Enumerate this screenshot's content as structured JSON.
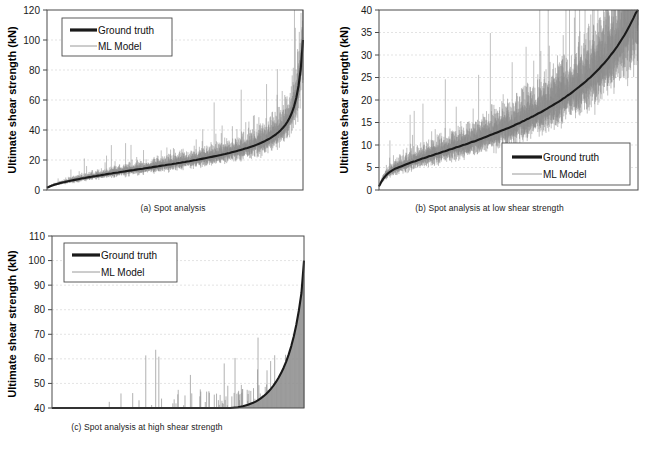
{
  "figure": {
    "panels": [
      "a",
      "b",
      "c"
    ],
    "colors": {
      "ground_truth": "#1a1a1a",
      "ml_model": "#8c8c8c",
      "axis": "#3f3f3f",
      "grid": "#d9d9d9",
      "background": "#ffffff"
    }
  },
  "chart_data": [
    {
      "id": "panel-a",
      "type": "line",
      "title": "",
      "caption": "(a) Spot analysis",
      "xlabel": "",
      "ylabel": "Ultimate shear strength (kN)",
      "ylim": [
        0,
        120
      ],
      "ytick_labels": [
        "0",
        "20",
        "40",
        "60",
        "80",
        "100",
        "120"
      ],
      "yticks": [
        0,
        20,
        40,
        60,
        80,
        100,
        120
      ],
      "xlim": [
        0,
        1
      ],
      "grid": true,
      "legend_position": "top-left",
      "legend": [
        "Ground truth",
        "ML Model"
      ],
      "series": [
        {
          "name": "Ground truth",
          "style": "thick-dark",
          "values": [
            1.5,
            2.2,
            2.8,
            3.3,
            3.8,
            4.2,
            4.6,
            5.0,
            5.3,
            5.7,
            6.0,
            6.3,
            6.6,
            6.9,
            7.2,
            7.5,
            7.8,
            8.0,
            8.3,
            8.6,
            8.8,
            9.1,
            9.3,
            9.6,
            9.8,
            10.1,
            10.3,
            10.6,
            10.8,
            11.0,
            11.3,
            11.5,
            11.7,
            12.0,
            12.2,
            12.4,
            12.7,
            12.9,
            13.1,
            13.3,
            13.6,
            13.8,
            14.0,
            14.2,
            14.5,
            14.7,
            14.9,
            15.1,
            15.4,
            15.6,
            15.8,
            16.1,
            16.3,
            16.5,
            16.8,
            17.0,
            17.2,
            17.5,
            17.7,
            18.0,
            18.2,
            18.5,
            18.7,
            19.0,
            19.2,
            19.5,
            19.8,
            20.0,
            20.3,
            20.6,
            20.9,
            21.2,
            21.5,
            21.8,
            22.1,
            22.4,
            22.7,
            23.0,
            23.3,
            23.7,
            24.0,
            24.4,
            24.7,
            25.1,
            25.5,
            25.9,
            26.3,
            26.7,
            27.1,
            27.6,
            28.0,
            28.5,
            29.0,
            29.5,
            30.1,
            30.7,
            31.3,
            32.0,
            32.7,
            33.5,
            34.3,
            35.2,
            36.2,
            37.3,
            38.5,
            39.9,
            41.5,
            43.3,
            45.5,
            48.2,
            51.5,
            55.8,
            61.5,
            69.5,
            81.0,
            100.0
          ]
        },
        {
          "name": "ML Model",
          "style": "thin-gray-noisy",
          "description": "Noisy predictions scattered around ground truth; spikes up to ~70 kN in mid-range, dense band width grows with magnitude"
        }
      ]
    },
    {
      "id": "panel-b",
      "type": "line",
      "title": "",
      "caption": "(b) Spot analysis at low shear strength",
      "xlabel": "",
      "ylabel": "Ultimate shear strength (kN)",
      "ylim": [
        0,
        40
      ],
      "ytick_labels": [
        "0",
        "5",
        "10",
        "15",
        "20",
        "25",
        "30",
        "35",
        "40"
      ],
      "yticks": [
        0,
        5,
        10,
        15,
        20,
        25,
        30,
        35,
        40
      ],
      "xlim": [
        0,
        1
      ],
      "grid": true,
      "legend_position": "bottom-right",
      "legend": [
        "Ground truth",
        "ML Model"
      ],
      "series": [
        {
          "name": "Ground truth",
          "style": "thick-dark",
          "values": [
            0.8,
            1.8,
            2.6,
            3.2,
            3.7,
            4.1,
            4.4,
            4.7,
            4.9,
            5.1,
            5.3,
            5.5,
            5.7,
            5.9,
            6.1,
            6.3,
            6.4,
            6.6,
            6.8,
            7.0,
            7.1,
            7.3,
            7.5,
            7.6,
            7.8,
            8.0,
            8.1,
            8.3,
            8.5,
            8.6,
            8.8,
            9.0,
            9.1,
            9.3,
            9.5,
            9.6,
            9.8,
            10.0,
            10.1,
            10.3,
            10.5,
            10.7,
            10.8,
            11.0,
            11.2,
            11.4,
            11.6,
            11.8,
            12.0,
            12.2,
            12.4,
            12.6,
            12.8,
            13.0,
            13.2,
            13.4,
            13.6,
            13.8,
            14.0,
            14.2,
            14.5,
            14.7,
            14.9,
            15.2,
            15.4,
            15.7,
            15.9,
            16.2,
            16.4,
            16.7,
            17.0,
            17.2,
            17.5,
            17.8,
            18.1,
            18.4,
            18.7,
            19.0,
            19.3,
            19.6,
            19.9,
            20.3,
            20.6,
            21.0,
            21.3,
            21.7,
            22.1,
            22.5,
            22.9,
            23.3,
            23.7,
            24.1,
            24.6,
            25.0,
            25.5,
            26.0,
            26.5,
            27.0,
            27.6,
            28.1,
            28.7,
            29.3,
            30.0,
            30.6,
            31.3,
            32.0,
            32.8,
            33.6,
            34.4,
            35.3,
            36.2,
            37.2,
            38.2,
            39.3,
            40.0
          ]
        },
        {
          "name": "ML Model",
          "style": "thin-gray-noisy",
          "description": "Dense noisy band around ground truth, many spikes clipping the 40 kN top of the axis in the right half"
        }
      ]
    },
    {
      "id": "panel-c",
      "type": "line",
      "title": "",
      "caption": "(c) Spot analysis at high shear strength",
      "xlabel": "",
      "ylabel": "Ultimate shear strength (kN)",
      "ylim": [
        40,
        110
      ],
      "ytick_labels": [
        "40",
        "50",
        "60",
        "70",
        "80",
        "90",
        "100",
        "110"
      ],
      "yticks": [
        40,
        50,
        60,
        70,
        80,
        90,
        100,
        110
      ],
      "xlim": [
        0,
        1
      ],
      "grid": true,
      "legend_position": "top-left",
      "legend": [
        "Ground truth",
        "ML Model"
      ],
      "series": [
        {
          "name": "Ground truth",
          "style": "thick-dark",
          "values": [
            40.0,
            40.0,
            40.0,
            40.0,
            40.0,
            40.0,
            40.0,
            40.0,
            40.0,
            40.0,
            40.0,
            40.0,
            40.0,
            40.0,
            40.0,
            40.0,
            40.0,
            40.0,
            40.0,
            40.0,
            40.0,
            40.0,
            40.0,
            40.0,
            40.0,
            40.0,
            40.0,
            40.0,
            40.0,
            40.0,
            40.0,
            40.0,
            40.0,
            40.0,
            40.0,
            40.0,
            40.0,
            40.0,
            40.0,
            40.0,
            40.0,
            40.0,
            40.0,
            40.0,
            40.0,
            40.0,
            40.0,
            40.0,
            40.0,
            40.0,
            40.0,
            40.0,
            40.0,
            40.0,
            40.0,
            40.0,
            40.0,
            40.0,
            40.0,
            40.0,
            40.0,
            40.0,
            40.0,
            40.0,
            40.0,
            40.0,
            40.0,
            40.0,
            40.0,
            40.0,
            40.0,
            40.1,
            40.2,
            40.3,
            40.5,
            40.7,
            41.0,
            41.3,
            41.7,
            42.1,
            42.6,
            43.2,
            43.9,
            44.7,
            45.6,
            46.6,
            47.8,
            49.1,
            50.6,
            52.3,
            54.2,
            56.4,
            58.9,
            61.8,
            65.2,
            69.2,
            74.0,
            79.8,
            86.8,
            100.0
          ]
        },
        {
          "name": "ML Model",
          "style": "thin-gray-noisy",
          "description": "Sparse vertical spikes rising from the 40 kN baseline, occasional spikes to 45-50 kN mid-right and up to 70 kN near the right edge"
        }
      ]
    }
  ],
  "panel_a": {
    "ylabel": "Ultimate shear strength (kN)",
    "caption": "(a) Spot analysis",
    "legend": {
      "ground_truth": "Ground truth",
      "ml_model": "ML Model"
    },
    "ticks": [
      "120",
      "100",
      "80",
      "60",
      "40",
      "20",
      "0"
    ]
  },
  "panel_b": {
    "ylabel": "Ultimate shear strength (kN)",
    "caption": "(b) Spot analysis at low shear strength",
    "legend": {
      "ground_truth": "Ground truth",
      "ml_model": "ML Model"
    },
    "ticks": [
      "40",
      "35",
      "30",
      "25",
      "20",
      "15",
      "10",
      "5",
      "0"
    ]
  },
  "panel_c": {
    "ylabel": "Ultimate shear strength (kN)",
    "caption": "(c) Spot analysis at high shear strength",
    "legend": {
      "ground_truth": "Ground truth",
      "ml_model": "ML Model"
    },
    "ticks": [
      "110",
      "100",
      "90",
      "80",
      "70",
      "60",
      "50",
      "40"
    ]
  }
}
